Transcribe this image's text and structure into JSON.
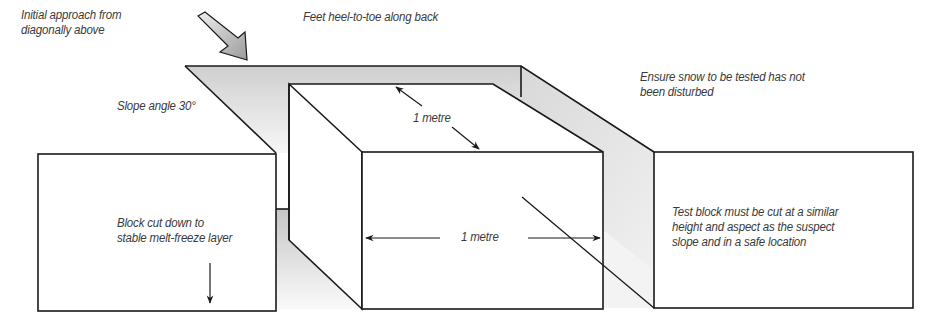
{
  "figure": {
    "colors": {
      "outline": "#1a1a1a",
      "shade_light": "#ececec",
      "shade_dark": "#c8c8c8",
      "text": "#3a3a3a"
    }
  },
  "labels": {
    "approach": "Initial approach from\ndiagonally above",
    "feet": "Feet heel-to-toe along back",
    "slope_angle": "Slope angle 30°",
    "undisturbed": "Ensure snow to be tested has not\nbeen disturbed",
    "depth_dim": "1 metre",
    "width_dim": "1 metre",
    "block_cut": "Block cut down to\nstable melt-freeze layer",
    "test_block": "Test block must be cut at a similar\nheight and aspect as the suspect\nslope and in a safe location"
  },
  "icons": {
    "approach_arrow": "thick-diagonal-arrow-icon",
    "down_arrow": "down-arrow-icon",
    "dimension_arrows": "double-headed-arrow-icon"
  }
}
